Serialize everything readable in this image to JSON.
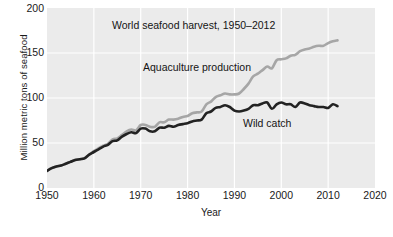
{
  "chart_data": {
    "type": "line",
    "title": "World seafood harvest, 1950–2012",
    "xlabel": "Year",
    "ylabel": "Million metric tons of seafood",
    "xlim": [
      1950,
      2020
    ],
    "ylim": [
      0,
      200
    ],
    "xticks": [
      1950,
      1960,
      1970,
      1980,
      1990,
      2000,
      2010,
      2020
    ],
    "yticks": [
      0,
      50,
      100,
      150,
      200
    ],
    "grid": true,
    "legend": "inline-annotations",
    "annotations": [
      {
        "text": "World seafood harvest, 1950–2012",
        "role": "title"
      },
      {
        "text": "Aquaculture production",
        "role": "series-label-total"
      },
      {
        "text": "Wild catch",
        "role": "series-label-wild"
      }
    ],
    "x": [
      1950,
      1951,
      1952,
      1953,
      1954,
      1955,
      1956,
      1957,
      1958,
      1959,
      1960,
      1961,
      1962,
      1963,
      1964,
      1965,
      1966,
      1967,
      1968,
      1969,
      1970,
      1971,
      1972,
      1973,
      1974,
      1975,
      1976,
      1977,
      1978,
      1979,
      1980,
      1981,
      1982,
      1983,
      1984,
      1985,
      1986,
      1987,
      1988,
      1989,
      1990,
      1991,
      1992,
      1993,
      1994,
      1995,
      1996,
      1997,
      1998,
      1999,
      2000,
      2001,
      2002,
      2003,
      2004,
      2005,
      2006,
      2007,
      2008,
      2009,
      2010,
      2011,
      2012
    ],
    "series": [
      {
        "name": "Aquaculture production",
        "color": "#a6a6a6",
        "description": "Total harvest including aquaculture; upper light-gray line",
        "values": [
          19,
          22,
          24,
          25,
          27,
          29,
          31,
          32,
          33,
          37,
          41,
          44,
          47,
          49,
          54,
          55,
          59,
          63,
          65,
          64,
          70,
          70,
          68,
          68,
          73,
          73,
          76,
          76,
          77,
          79,
          80,
          83,
          84,
          85,
          93,
          96,
          101,
          103,
          105,
          104,
          104,
          105,
          110,
          116,
          124,
          127,
          131,
          135,
          133,
          142,
          143,
          144,
          147,
          148,
          152,
          154,
          155,
          157,
          158,
          158,
          161,
          163,
          164
        ]
      },
      {
        "name": "Wild catch",
        "color": "#222222",
        "description": "Capture fisheries only; lower dark line",
        "values": [
          19,
          22,
          24,
          25,
          27,
          29,
          31,
          32,
          33,
          37,
          40,
          43,
          46,
          48,
          52,
          53,
          57,
          60,
          62,
          61,
          66,
          66,
          63,
          63,
          67,
          67,
          69,
          68,
          70,
          71,
          72,
          74,
          75,
          76,
          83,
          85,
          89,
          90,
          92,
          90,
          86,
          85,
          86,
          88,
          92,
          92,
          94,
          95,
          88,
          93,
          95,
          93,
          93,
          90,
          95,
          94,
          92,
          91,
          90,
          90,
          89,
          93,
          91
        ]
      }
    ]
  },
  "caption": {
    "text": ""
  }
}
